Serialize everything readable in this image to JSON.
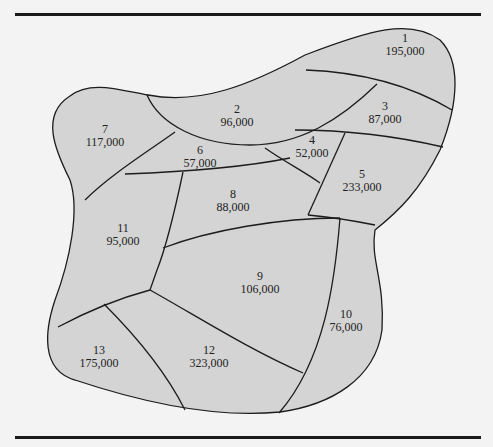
{
  "colors": {
    "background": "#f3f3f3",
    "region_fill": "#d4d4d4",
    "border": "#1c1c1c",
    "rule": "#1a1a1a"
  },
  "regions": [
    {
      "id": "1",
      "population": "195,000"
    },
    {
      "id": "2",
      "population": "96,000"
    },
    {
      "id": "3",
      "population": "87,000"
    },
    {
      "id": "4",
      "population": "52,000"
    },
    {
      "id": "5",
      "population": "233,000"
    },
    {
      "id": "6",
      "population": "57,000"
    },
    {
      "id": "7",
      "population": "117,000"
    },
    {
      "id": "8",
      "population": "88,000"
    },
    {
      "id": "9",
      "population": "106,000"
    },
    {
      "id": "10",
      "population": "76,000"
    },
    {
      "id": "11",
      "population": "95,000"
    },
    {
      "id": "12",
      "population": "323,000"
    },
    {
      "id": "13",
      "population": "175,000"
    }
  ]
}
